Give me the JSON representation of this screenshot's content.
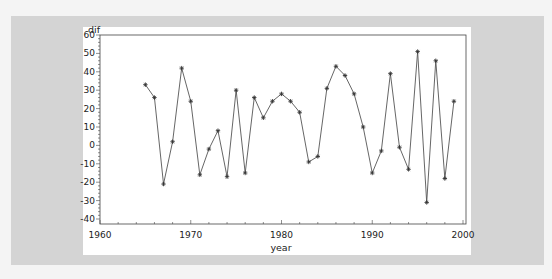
{
  "chart_data": {
    "type": "line",
    "title": "",
    "xlabel": "year",
    "ylabel": "dif",
    "xlim": [
      1960,
      2000
    ],
    "ylim": [
      -40,
      60
    ],
    "x_ticks": [
      1960,
      1970,
      1980,
      1990,
      2000
    ],
    "y_ticks": [
      -40,
      -30,
      -20,
      -10,
      0,
      10,
      20,
      30,
      40,
      50,
      60
    ],
    "grid": false,
    "legend": null,
    "marker": "star",
    "series": [
      {
        "name": "dif",
        "x": [
          1965,
          1966,
          1967,
          1968,
          1969,
          1970,
          1971,
          1972,
          1973,
          1974,
          1975,
          1976,
          1977,
          1978,
          1979,
          1980,
          1981,
          1982,
          1983,
          1984,
          1985,
          1986,
          1987,
          1988,
          1989,
          1990,
          1991,
          1992,
          1993,
          1994,
          1995,
          1996,
          1997,
          1998,
          1999
        ],
        "values": [
          33,
          26,
          -21,
          2,
          42,
          24,
          -16,
          -2,
          8,
          -17,
          30,
          -15,
          26,
          15,
          24,
          28,
          24,
          18,
          -9,
          -6,
          31,
          43,
          38,
          28,
          10,
          -15,
          -3,
          39,
          -1,
          -13,
          51,
          -31,
          46,
          -18,
          24
        ]
      }
    ]
  },
  "colors": {
    "line": "#555555",
    "marker": "#333333",
    "axis": "#444444",
    "panel": "#ffffff",
    "background": "#d4d4d4"
  }
}
